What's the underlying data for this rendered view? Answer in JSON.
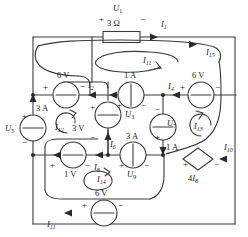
{
  "diagram": {
    "type": "circuit-schematic",
    "stroke_color": "#333333",
    "background_color": "#ffffff"
  },
  "components": {
    "resistor_top": {
      "label": "3 Ω",
      "voltage_label": "U",
      "voltage_sub": "1",
      "plus": "+",
      "minus": "−"
    },
    "source_6v_left": {
      "label": "6 V",
      "plus": "+",
      "minus": "−"
    },
    "source_6v_right": {
      "label": "6 V",
      "plus": "+",
      "minus": "−"
    },
    "source_6v_bottom": {
      "label": "6 V",
      "plus": "+",
      "minus": "−"
    },
    "source_1a_center": {
      "label": "1 A",
      "voltage_label": "U",
      "voltage_sub": "3",
      "plus": "+",
      "minus": "−"
    },
    "source_3a_left": {
      "label": "3 A",
      "voltage_label": "U",
      "voltage_sub": "5",
      "plus": "+",
      "minus": "−"
    },
    "source_3a_center": {
      "label": "3 A",
      "voltage_label": "U",
      "voltage_sub": "9",
      "plus": "+",
      "minus": "−"
    },
    "source_1a_right": {
      "label": "1 A",
      "voltage_label": "U",
      "voltage_sub": "7",
      "plus": "+",
      "minus": "−"
    },
    "source_3v": {
      "label": "3 V",
      "plus": "+",
      "minus": "−"
    },
    "source_1v": {
      "label": "1 V",
      "plus": "+",
      "minus": "−"
    },
    "dependent_source": {
      "label": "4I",
      "label_sub": "8",
      "plus": "+",
      "minus": "−"
    }
  },
  "branch_currents": [
    {
      "name": "I",
      "sub": "1"
    },
    {
      "name": "I",
      "sub": "2"
    },
    {
      "name": "I",
      "sub": "4"
    },
    {
      "name": "I",
      "sub": "6"
    },
    {
      "name": "I",
      "sub": "8"
    },
    {
      "name": "I",
      "sub": "10"
    },
    {
      "name": "I",
      "sub": "11"
    },
    {
      "name": "I",
      "sub": "15"
    }
  ],
  "mesh_currents": [
    {
      "name": "I",
      "sub": "11"
    },
    {
      "name": "I",
      "sub": "12"
    },
    {
      "name": "I",
      "sub": "13"
    },
    {
      "name": "I",
      "sub": "14"
    }
  ]
}
